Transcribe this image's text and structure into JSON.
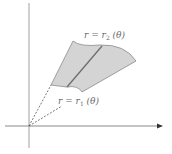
{
  "diagram": {
    "type": "polar-region",
    "labels": {
      "outer_curve": {
        "lhs": "r",
        "eq": " = ",
        "var": "r",
        "sub": "2",
        "arg": " (θ)"
      },
      "inner_curve": {
        "lhs": "r",
        "eq": " = ",
        "var": "r",
        "sub": "1",
        "arg": " (θ)"
      }
    },
    "colors": {
      "region_fill": "#d4d4d4",
      "region_stroke": "#8a8a8a",
      "divider": "#6e6e6e",
      "axes": "#9a9a9a",
      "dashed": "#6a6a6a"
    }
  }
}
